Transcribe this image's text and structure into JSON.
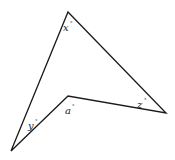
{
  "diagram": {
    "type": "concave-quadrilateral",
    "vertices": {
      "top": [
        68,
        12
      ],
      "right": [
        166,
        113
      ],
      "inner": [
        68,
        96
      ],
      "bottom_left": [
        11,
        151
      ]
    },
    "angles": [
      {
        "label": "x",
        "unit": "°",
        "vertex": "top",
        "pos": [
          64,
          30
        ]
      },
      {
        "label": "z",
        "unit": "°",
        "vertex": "right",
        "pos": [
          137,
          107
        ]
      },
      {
        "label": "a",
        "unit": "°",
        "vertex": "inner",
        "pos": [
          65,
          112
        ]
      },
      {
        "label": "y",
        "unit": "°",
        "vertex": "bottom_left",
        "pos": [
          28,
          128
        ]
      }
    ],
    "stroke_color": "#1a1a1a"
  }
}
